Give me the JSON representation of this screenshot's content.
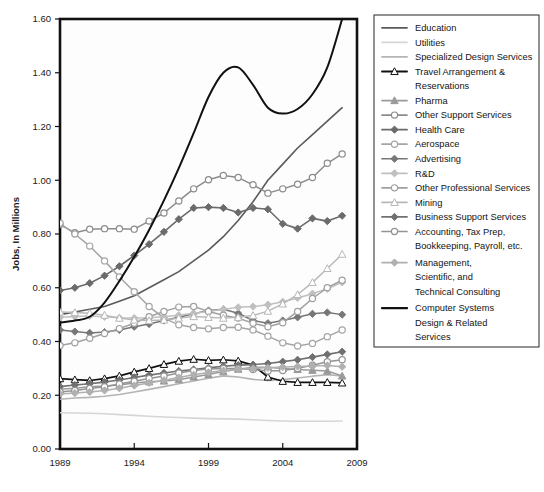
{
  "chart_data": {
    "type": "line",
    "title": "",
    "xlabel": "",
    "ylabel": "Jobs, In Millions",
    "xlim": [
      1989,
      2009
    ],
    "ylim": [
      0.0,
      1.6
    ],
    "xticks": [
      "1989",
      "1994",
      "1999",
      "2004",
      "2009"
    ],
    "xtick_values": [
      1989,
      1994,
      1999,
      2004,
      2009
    ],
    "yticks": [
      "0.00",
      "0.20",
      "0.40",
      "0.60",
      "0.80",
      "1.00",
      "1.20",
      "1.40",
      "1.60"
    ],
    "ytick_values": [
      0.0,
      0.2,
      0.4,
      0.6,
      0.8,
      1.0,
      1.2,
      1.4,
      1.6
    ],
    "grid": false,
    "legend_position": "right",
    "x": [
      1989,
      1990,
      1991,
      1992,
      1993,
      1994,
      1995,
      1996,
      1997,
      1998,
      1999,
      2000,
      2001,
      2002,
      2003,
      2004,
      2005,
      2006,
      2007,
      2008
    ],
    "series": [
      {
        "name": "Education",
        "color": "#5a5a5a",
        "marker": "none",
        "marker_fill": "none",
        "width": 1.6,
        "values": [
          0.5,
          0.51,
          0.52,
          0.53,
          0.55,
          0.57,
          0.6,
          0.63,
          0.66,
          0.7,
          0.74,
          0.79,
          0.85,
          0.92,
          1.0,
          1.06,
          1.12,
          1.17,
          1.22,
          1.27
        ]
      },
      {
        "name": "Utilities",
        "color": "#d6d6d6",
        "marker": "none",
        "marker_fill": "none",
        "width": 1.6,
        "values": [
          0.135,
          0.134,
          0.133,
          0.131,
          0.128,
          0.125,
          0.122,
          0.119,
          0.117,
          0.115,
          0.113,
          0.112,
          0.111,
          0.109,
          0.106,
          0.104,
          0.103,
          0.103,
          0.103,
          0.104
        ]
      },
      {
        "name": "Specialized Design Services",
        "color": "#b4b4b4",
        "marker": "none",
        "marker_fill": "none",
        "width": 1.6,
        "values": [
          0.185,
          0.19,
          0.192,
          0.196,
          0.203,
          0.212,
          0.222,
          0.232,
          0.243,
          0.253,
          0.263,
          0.272,
          0.268,
          0.259,
          0.255,
          0.258,
          0.264,
          0.271,
          0.276,
          0.272
        ]
      },
      {
        "name": "Travel Arrangement & Reservations",
        "color": "#111111",
        "marker": "triangle",
        "marker_fill": "#ffffff",
        "width": 1.7,
        "values": [
          0.262,
          0.258,
          0.255,
          0.262,
          0.272,
          0.287,
          0.3,
          0.315,
          0.327,
          0.334,
          0.33,
          0.332,
          0.328,
          0.312,
          0.268,
          0.252,
          0.248,
          0.248,
          0.248,
          0.246
        ]
      },
      {
        "name": "Pharma",
        "color": "#9a9a9a",
        "marker": "triangle",
        "marker_fill": "#9a9a9a",
        "width": 1.5,
        "values": [
          0.222,
          0.226,
          0.232,
          0.234,
          0.238,
          0.246,
          0.25,
          0.253,
          0.258,
          0.268,
          0.277,
          0.288,
          0.297,
          0.304,
          0.304,
          0.3,
          0.296,
          0.293,
          0.29,
          0.272
        ]
      },
      {
        "name": "Other Support Services",
        "color": "#8c8c8c",
        "marker": "circle",
        "marker_fill": "#ffffff",
        "width": 1.5,
        "values": [
          0.835,
          0.805,
          0.818,
          0.82,
          0.82,
          0.818,
          0.848,
          0.878,
          0.923,
          0.968,
          1.002,
          1.018,
          1.01,
          0.983,
          0.952,
          0.968,
          0.985,
          1.01,
          1.063,
          1.098
        ]
      },
      {
        "name": "Health Care",
        "color": "#6b6b6b",
        "marker": "diamond",
        "marker_fill": "#6b6b6b",
        "width": 1.6,
        "values": [
          0.59,
          0.6,
          0.617,
          0.645,
          0.68,
          0.72,
          0.762,
          0.808,
          0.855,
          0.897,
          0.9,
          0.897,
          0.88,
          0.897,
          0.892,
          0.838,
          0.82,
          0.858,
          0.848,
          0.868
        ]
      },
      {
        "name": "Aerospace",
        "color": "#a5a5a5",
        "marker": "circle",
        "marker_fill": "#ffffff",
        "width": 1.5,
        "values": [
          0.84,
          0.8,
          0.755,
          0.7,
          0.64,
          0.585,
          0.53,
          0.487,
          0.462,
          0.452,
          0.447,
          0.452,
          0.453,
          0.443,
          0.42,
          0.395,
          0.383,
          0.393,
          0.418,
          0.443
        ]
      },
      {
        "name": "Advertising",
        "color": "#777777",
        "marker": "diamond",
        "marker_fill": "#777777",
        "width": 1.5,
        "values": [
          0.443,
          0.437,
          0.432,
          0.435,
          0.443,
          0.455,
          0.465,
          0.478,
          0.49,
          0.503,
          0.515,
          0.52,
          0.505,
          0.478,
          0.468,
          0.478,
          0.49,
          0.503,
          0.508,
          0.5
        ]
      },
      {
        "name": "R&D",
        "color": "#c0c0c0",
        "marker": "diamond",
        "marker_fill": "#c0c0c0",
        "width": 1.5,
        "values": [
          0.49,
          0.493,
          0.495,
          0.492,
          0.488,
          0.487,
          0.488,
          0.492,
          0.498,
          0.505,
          0.512,
          0.52,
          0.527,
          0.53,
          0.537,
          0.548,
          0.562,
          0.578,
          0.596,
          0.62
        ]
      },
      {
        "name": "Other Professional Services",
        "color": "#a0a0a0",
        "marker": "circle",
        "marker_fill": "#ffffff",
        "width": 1.5,
        "values": [
          0.385,
          0.395,
          0.412,
          0.43,
          0.448,
          0.468,
          0.492,
          0.512,
          0.528,
          0.53,
          0.512,
          0.498,
          0.487,
          0.468,
          0.455,
          0.47,
          0.512,
          0.56,
          0.6,
          0.628
        ]
      },
      {
        "name": "Mining",
        "color": "#b8b8b8",
        "marker": "triangle",
        "marker_fill": "#ffffff",
        "width": 1.4,
        "values": [
          0.51,
          0.508,
          0.505,
          0.498,
          0.487,
          0.48,
          0.478,
          0.48,
          0.487,
          0.493,
          0.49,
          0.487,
          0.49,
          0.497,
          0.513,
          0.54,
          0.575,
          0.62,
          0.672,
          0.725
        ]
      },
      {
        "name": "Business Support Services",
        "color": "#707070",
        "marker": "diamond",
        "marker_fill": "#707070",
        "width": 1.6,
        "values": [
          0.232,
          0.238,
          0.243,
          0.249,
          0.257,
          0.266,
          0.275,
          0.283,
          0.29,
          0.296,
          0.302,
          0.308,
          0.312,
          0.314,
          0.318,
          0.325,
          0.332,
          0.342,
          0.352,
          0.362
        ]
      },
      {
        "name": "Accounting, Tax Prep, Bookkeeping, Payroll, etc.",
        "color": "#949494",
        "marker": "circle",
        "marker_fill": "#ffffff",
        "width": 1.5,
        "values": [
          0.212,
          0.218,
          0.225,
          0.232,
          0.242,
          0.252,
          0.262,
          0.272,
          0.283,
          0.292,
          0.298,
          0.3,
          0.3,
          0.296,
          0.29,
          0.292,
          0.3,
          0.312,
          0.325,
          0.332
        ]
      },
      {
        "name": "Management, Scientific, and Technical Consulting",
        "color": "#b0b0b0",
        "marker": "diamond",
        "marker_fill": "#b0b0b0",
        "width": 1.5,
        "values": [
          0.205,
          0.208,
          0.212,
          0.218,
          0.226,
          0.236,
          0.246,
          0.256,
          0.266,
          0.276,
          0.285,
          0.292,
          0.297,
          0.3,
          0.302,
          0.305,
          0.307,
          0.309,
          0.311,
          0.306
        ]
      },
      {
        "name": "Computer Systems Design & Related Services",
        "color": "#111111",
        "marker": "none",
        "marker_fill": "none",
        "width": 2.0,
        "smooth": true,
        "values": [
          0.47,
          0.478,
          0.492,
          0.545,
          0.625,
          0.715,
          0.815,
          0.925,
          1.045,
          1.175,
          1.31,
          1.4,
          1.42,
          1.355,
          1.27,
          1.248,
          1.265,
          1.32,
          1.42,
          1.6
        ]
      }
    ]
  },
  "legend": {
    "items": [
      {
        "label": "Education"
      },
      {
        "label": "Utilities"
      },
      {
        "label": "Specialized Design Services"
      },
      {
        "label": "Travel Arrangement &"
      },
      {
        "label": "Reservations"
      },
      {
        "label": "Pharma"
      },
      {
        "label": "Other Support Services"
      },
      {
        "label": "Health Care"
      },
      {
        "label": "Aerospace"
      },
      {
        "label": "Advertising"
      },
      {
        "label": "R&D"
      },
      {
        "label": "Other Professional Services"
      },
      {
        "label": "Mining"
      },
      {
        "label": "Business Support Services"
      },
      {
        "label": "Accounting, Tax Prep,"
      },
      {
        "label": "Bookkeeping, Payroll, etc."
      },
      {
        "label": "Management,"
      },
      {
        "label": "Scientific, and"
      },
      {
        "label": "Technical Consulting"
      },
      {
        "label": "Computer Systems"
      },
      {
        "label": "Design & Related"
      },
      {
        "label": "Services"
      }
    ]
  }
}
